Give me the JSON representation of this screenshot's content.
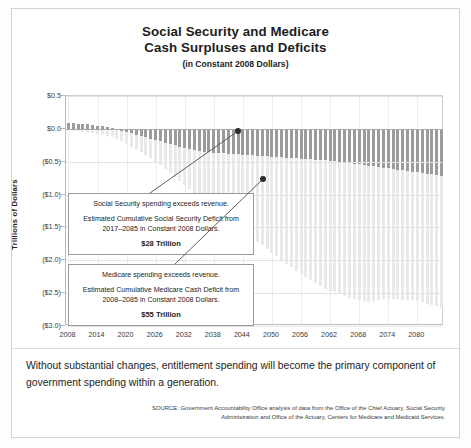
{
  "title": {
    "line1": "Social Security and Medicare",
    "line2": "Cash Surpluses and Deficits",
    "subtitle": "(in Constant 2008 Dollars)"
  },
  "caption": "Without substantial changes, entitlement spending will become the primary component of government spending within a generation.",
  "source": "SOURCE: Government Accountability Office analysis of data from the Office of the Chief Actuary, Social Security Administration and Office of the Actuary, Centers for Medicare and Medicaid Services.",
  "callouts": {
    "social_security": {
      "line1": "Social Security spending exceeds revenue.",
      "line2": "Estimated Cumulative Social Security Deficit from 2017–2085 in Constant 2008 Dollars.",
      "amount": "$28 Trillion"
    },
    "medicare": {
      "line1": "Medicare spending exceeds revenue.",
      "line2": "Estimated Cumulative Medicare Cash Deficit from 2008–2085 in Constant 2008 Dollars.",
      "amount": "$55 Trillion"
    }
  },
  "colors": {
    "social_security": "#9b9b9b",
    "medicare": "#e9e9e9",
    "axis": "#b9b9b9",
    "grid": "#e2e2e2"
  },
  "chart_data": {
    "type": "bar",
    "stacked": true,
    "title": "Social Security and Medicare Cash Surpluses and Deficits (in Constant 2008 Dollars)",
    "xlabel": "",
    "ylabel": "Trillions of Dollars",
    "ylim": [
      -3.0,
      0.5
    ],
    "ytick_values": [
      0.5,
      0.0,
      -0.5,
      -1.0,
      -1.5,
      -2.0,
      -2.5,
      -3.0
    ],
    "ytick_labels": [
      "$0.5",
      "$0.0",
      "($0.5)",
      "($1.0)",
      "($1.5)",
      "($2.0)",
      "($2.5)",
      "($3.0)"
    ],
    "xtick_labels": [
      "2008",
      "2014",
      "2020",
      "2026",
      "2032",
      "2038",
      "2044",
      "2050",
      "2056",
      "2062",
      "2068",
      "2074",
      "2080"
    ],
    "xlim": [
      2008,
      2085
    ],
    "grid": true,
    "legend": "none",
    "x": [
      2008,
      2009,
      2010,
      2011,
      2012,
      2013,
      2014,
      2015,
      2016,
      2017,
      2018,
      2019,
      2020,
      2021,
      2022,
      2023,
      2024,
      2025,
      2026,
      2027,
      2028,
      2029,
      2030,
      2031,
      2032,
      2033,
      2034,
      2035,
      2036,
      2037,
      2038,
      2039,
      2040,
      2041,
      2042,
      2043,
      2044,
      2045,
      2046,
      2047,
      2048,
      2049,
      2050,
      2051,
      2052,
      2053,
      2054,
      2055,
      2056,
      2057,
      2058,
      2059,
      2060,
      2061,
      2062,
      2063,
      2064,
      2065,
      2066,
      2067,
      2068,
      2069,
      2070,
      2071,
      2072,
      2073,
      2074,
      2075,
      2076,
      2077,
      2078,
      2079,
      2080,
      2081,
      2082,
      2083,
      2084,
      2085
    ],
    "series": [
      {
        "name": "Social Security",
        "values": [
          0.09,
          0.085,
          0.08,
          0.075,
          0.07,
          0.06,
          0.05,
          0.042,
          0.03,
          0.015,
          -0.01,
          -0.03,
          -0.05,
          -0.07,
          -0.09,
          -0.11,
          -0.13,
          -0.15,
          -0.17,
          -0.19,
          -0.21,
          -0.23,
          -0.25,
          -0.27,
          -0.29,
          -0.31,
          -0.32,
          -0.335,
          -0.345,
          -0.355,
          -0.365,
          -0.37,
          -0.375,
          -0.38,
          -0.385,
          -0.39,
          -0.395,
          -0.4,
          -0.405,
          -0.41,
          -0.415,
          -0.42,
          -0.425,
          -0.43,
          -0.435,
          -0.44,
          -0.445,
          -0.45,
          -0.455,
          -0.46,
          -0.465,
          -0.47,
          -0.475,
          -0.48,
          -0.485,
          -0.49,
          -0.5,
          -0.51,
          -0.52,
          -0.53,
          -0.54,
          -0.55,
          -0.56,
          -0.57,
          -0.58,
          -0.59,
          -0.6,
          -0.61,
          -0.62,
          -0.63,
          -0.64,
          -0.65,
          -0.66,
          -0.67,
          -0.68,
          -0.69,
          -0.7,
          -0.71
        ]
      },
      {
        "name": "Medicare",
        "values": [
          -0.02,
          -0.03,
          -0.04,
          -0.05,
          -0.06,
          -0.07,
          -0.08,
          -0.095,
          -0.11,
          -0.125,
          -0.14,
          -0.16,
          -0.18,
          -0.2,
          -0.22,
          -0.245,
          -0.27,
          -0.3,
          -0.33,
          -0.36,
          -0.4,
          -0.44,
          -0.48,
          -0.52,
          -0.56,
          -0.61,
          -0.66,
          -0.71,
          -0.76,
          -0.81,
          -0.86,
          -0.91,
          -0.96,
          -1.01,
          -1.06,
          -1.11,
          -1.16,
          -1.21,
          -1.26,
          -1.31,
          -1.36,
          -1.41,
          -1.46,
          -1.51,
          -1.56,
          -1.61,
          -1.66,
          -1.71,
          -1.75,
          -1.79,
          -1.83,
          -1.87,
          -1.91,
          -1.95,
          -1.98,
          -2.0,
          -2.02,
          -2.04,
          -2.05,
          -2.06,
          -2.07,
          -2.075,
          -2.08,
          -2.05,
          -2.02,
          -2.0,
          -1.99,
          -1.98,
          -1.97,
          -1.97,
          -1.96,
          -1.96,
          -1.96,
          -1.97,
          -1.98,
          -1.99,
          -2.0,
          -2.01
        ]
      }
    ]
  }
}
